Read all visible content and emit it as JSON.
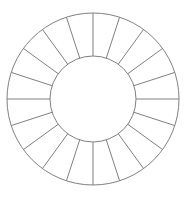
{
  "diagram": {
    "type": "segmented-ring",
    "segment_count": 20,
    "center": [
      93,
      99
    ],
    "outer_radius": 86,
    "inner_radius": 43,
    "stroke_color": "#808080",
    "fill_color": "#ffffff",
    "stroke_width": 1,
    "start_angle_deg": -90,
    "segments": [
      {
        "index": 0
      },
      {
        "index": 1
      },
      {
        "index": 2
      },
      {
        "index": 3
      },
      {
        "index": 4
      },
      {
        "index": 5
      },
      {
        "index": 6
      },
      {
        "index": 7
      },
      {
        "index": 8
      },
      {
        "index": 9
      },
      {
        "index": 10
      },
      {
        "index": 11
      },
      {
        "index": 12
      },
      {
        "index": 13
      },
      {
        "index": 14
      },
      {
        "index": 15
      },
      {
        "index": 16
      },
      {
        "index": 17
      },
      {
        "index": 18
      },
      {
        "index": 19
      }
    ]
  }
}
